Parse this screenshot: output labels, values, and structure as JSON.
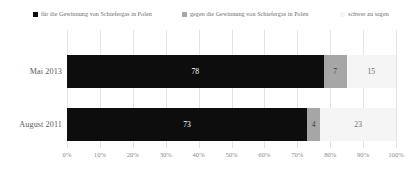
{
  "chart_data": {
    "type": "bar",
    "orientation": "horizontal",
    "stacked": true,
    "stack_mode": "percent",
    "title": "",
    "subtitle": "",
    "xlabel": "",
    "ylabel": "",
    "xlim": [
      0,
      100
    ],
    "grid": true,
    "legend_position": "top",
    "categories": [
      "Mai 2013",
      "August 2011"
    ],
    "xticks": [
      "0%",
      "10%",
      "20%",
      "30%",
      "40%",
      "50%",
      "60%",
      "70%",
      "80%",
      "90%",
      "100%"
    ],
    "xtick_values": [
      0,
      10,
      20,
      30,
      40,
      50,
      60,
      70,
      80,
      90,
      100
    ],
    "series": [
      {
        "name": "für die Gewinnung von Schiefergas in Polen",
        "color": "#0d0d0d",
        "label_color": "#ffffff",
        "swatch": "legend-swatch-black",
        "values": [
          78,
          73
        ],
        "labels": [
          "78",
          "73"
        ]
      },
      {
        "name": "gegen die Gewinnung von Schiefergas in Polen",
        "color": "#a6a6a6",
        "label_color": "#404040",
        "swatch": "legend-swatch-gray",
        "values": [
          7,
          4
        ],
        "labels": [
          "7",
          "4"
        ]
      },
      {
        "name": "schwer zu sagen",
        "color": "#f5f5f5",
        "label_color": "#6e6e6e",
        "swatch": "legend-swatch-white",
        "values": [
          15,
          23
        ],
        "labels": [
          "15",
          "23"
        ]
      }
    ]
  }
}
